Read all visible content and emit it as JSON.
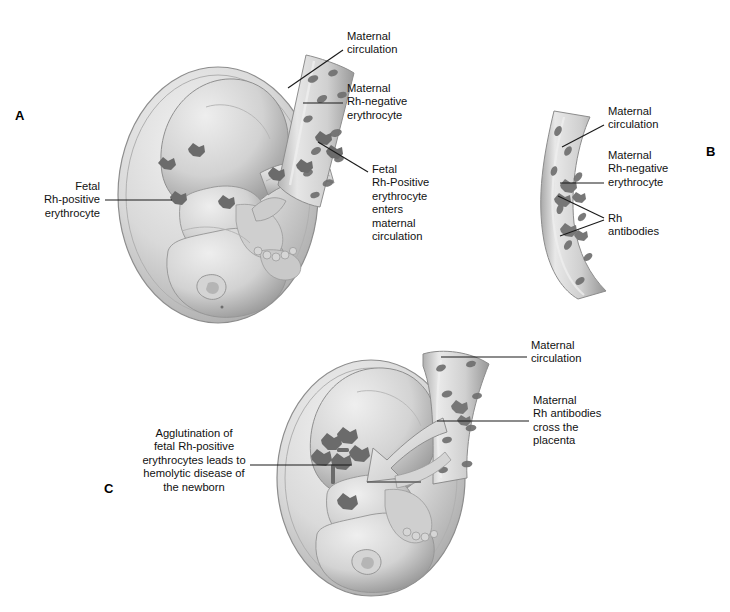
{
  "figure": {
    "background_color": "#ffffff",
    "ink_color": "#111111"
  },
  "panels": [
    {
      "letter": "A",
      "labels": [
        {
          "id": "a-maternal-circulation",
          "text": "Maternal\ncirculation"
        },
        {
          "id": "a-maternal-rh-negative-erythrocyte",
          "text": "Maternal\nRh-negative\nerythrocyte"
        },
        {
          "id": "a-fetal-rh-positive-enters",
          "text": "Fetal\nRh-Positive\nerythrocyte\nenters\nmaternal\ncirculation"
        },
        {
          "id": "a-fetal-rh-positive-erythrocyte",
          "text": "Fetal\nRh-positive\nerythrocyte"
        }
      ]
    },
    {
      "letter": "B",
      "labels": [
        {
          "id": "b-maternal-circulation",
          "text": "Maternal\ncirculation"
        },
        {
          "id": "b-maternal-rh-negative-erythrocyte",
          "text": "Maternal\nRh-negative\nerythrocyte"
        },
        {
          "id": "b-rh-antibodies",
          "text": "Rh\nantibodies"
        }
      ]
    },
    {
      "letter": "C",
      "labels": [
        {
          "id": "c-maternal-circulation",
          "text": "Maternal\ncirculation"
        },
        {
          "id": "c-maternal-rh-antibodies-cross",
          "text": "Maternal\nRh antibodies\ncross the\nplacenta"
        },
        {
          "id": "c-agglutination",
          "text": "Agglutination of\nfetal Rh-positive\nerythrocytes leads to\nhemolytic disease of\nthe newborn"
        }
      ]
    }
  ]
}
